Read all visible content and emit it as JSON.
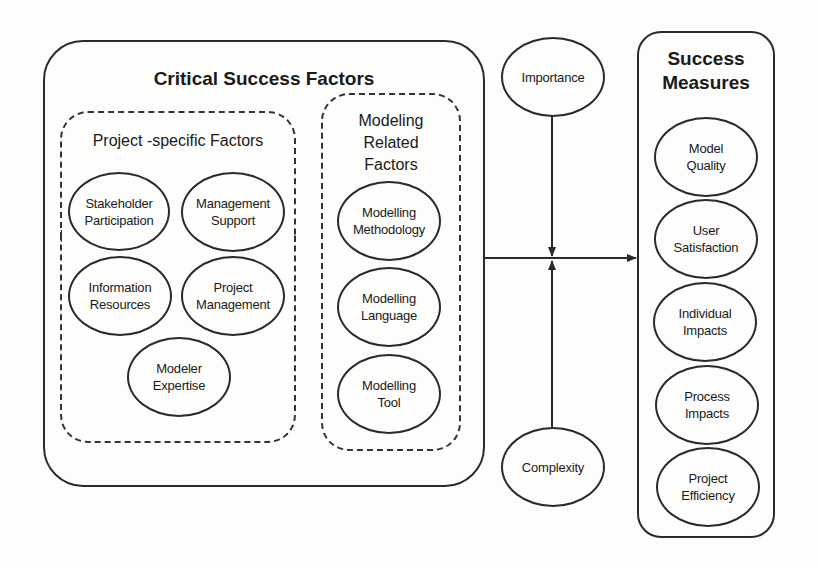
{
  "critical_success_factors": {
    "title": "Critical Success Factors",
    "project_specific": {
      "title": "Project -specific Factors",
      "items": [
        "Stakeholder\nParticipation",
        "Management\nSupport",
        "Information\nResources",
        "Project\nManagement",
        "Modeler\nExpertise"
      ]
    },
    "modeling_related": {
      "title": "Modeling\nRelated\nFactors",
      "items": [
        "Modelling\nMethodology",
        "Modelling\nLanguage",
        "Modelling\nTool"
      ]
    }
  },
  "moderators": {
    "top": "Importance",
    "bottom": "Complexity"
  },
  "success_measures": {
    "title": "Success\nMeasures",
    "items": [
      "Model\nQuality",
      "User\nSatisfaction",
      "Individual\nImpacts",
      "Process\nImpacts",
      "Project\nEfficiency"
    ]
  },
  "colors": {
    "line": "#2a2a2a",
    "background": "#fdfdfc"
  }
}
